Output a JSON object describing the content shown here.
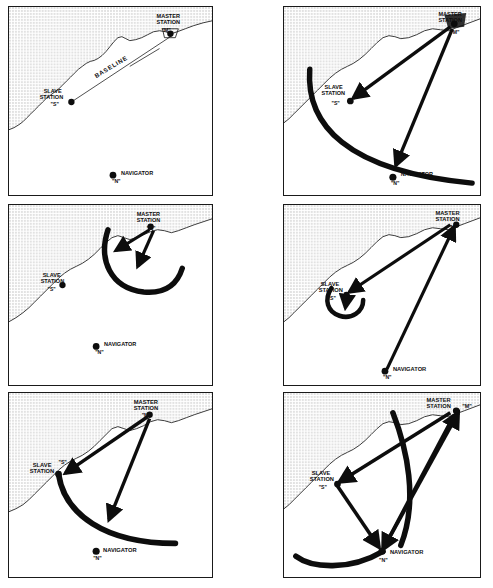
{
  "figure": {
    "panel_count": 6,
    "columns": 2,
    "rows": 3,
    "colors": {
      "ink": "#0d0d0d",
      "land_fill": "#d9d9d9",
      "water_fill": "#ffffff",
      "border": "#1a1a1a",
      "coastline": "#3a3a3a"
    }
  },
  "labels": {
    "master_station": "MASTER",
    "master_station_line2": "STATION",
    "master_quote": "\"M\"",
    "slave_station": "SLAVE",
    "slave_station_line2": "STATION",
    "slave_quote": "\"S\"",
    "navigator": "NAVIGATOR",
    "navigator_quote": "\"N\"",
    "baseline": "BASELINE"
  },
  "panels": [
    {
      "id": "panel-1",
      "index": 1,
      "position": {
        "x": 8,
        "y": 6,
        "w": 205,
        "h": 190
      },
      "caption": "Baseline between master and slave stations with navigator at sea",
      "shows_baseline": true,
      "arrows": [],
      "arcs": [],
      "stations": [
        "master",
        "slave",
        "navigator"
      ]
    },
    {
      "id": "panel-2",
      "index": 2,
      "position": {
        "x": 283,
        "y": 6,
        "w": 198,
        "h": 190
      },
      "caption": "Master station transmits; pulse travels to slave station and navigator",
      "shows_baseline": false,
      "arrows": [
        "master-to-slave",
        "master-to-navigator"
      ],
      "arcs": [
        "master-wavefront"
      ],
      "stations": [
        "master",
        "slave",
        "navigator"
      ]
    },
    {
      "id": "panel-3",
      "index": 3,
      "position": {
        "x": 8,
        "y": 204,
        "w": 205,
        "h": 182
      },
      "caption": "Master pulse expanding outward as circular wavefront",
      "shows_baseline": false,
      "arrows": [
        "master-down-left",
        "master-down-right"
      ],
      "arcs": [
        "master-near-wavefront"
      ],
      "stations": [
        "master",
        "slave",
        "navigator"
      ]
    },
    {
      "id": "panel-4",
      "index": 4,
      "position": {
        "x": 283,
        "y": 204,
        "w": 198,
        "h": 182
      },
      "caption": "Slave station receives master pulse and prepares to retransmit",
      "shows_baseline": false,
      "arrows": [
        "master-to-slave",
        "navigator-to-master"
      ],
      "arcs": [
        "slave-small-wavefront"
      ],
      "stations": [
        "master",
        "slave",
        "navigator"
      ]
    },
    {
      "id": "panel-5",
      "index": 5,
      "position": {
        "x": 8,
        "y": 392,
        "w": 205,
        "h": 186
      },
      "caption": "Slave transmits its own pulse; wavefront spreads seaward",
      "shows_baseline": false,
      "arrows": [
        "master-to-slave",
        "master-to-sea"
      ],
      "arcs": [
        "slave-wavefront"
      ],
      "stations": [
        "master",
        "slave",
        "navigator"
      ]
    },
    {
      "id": "panel-6",
      "index": 6,
      "position": {
        "x": 283,
        "y": 392,
        "w": 198,
        "h": 186
      },
      "caption": "Navigator receives both master and slave pulses and measures time difference",
      "shows_baseline": false,
      "arrows": [
        "master-to-slave",
        "slave-to-navigator",
        "master-to-navigator",
        "navigator-to-master"
      ],
      "arcs": [
        "slave-wavefront",
        "master-wavefront"
      ],
      "stations": [
        "master",
        "slave",
        "navigator"
      ]
    }
  ]
}
